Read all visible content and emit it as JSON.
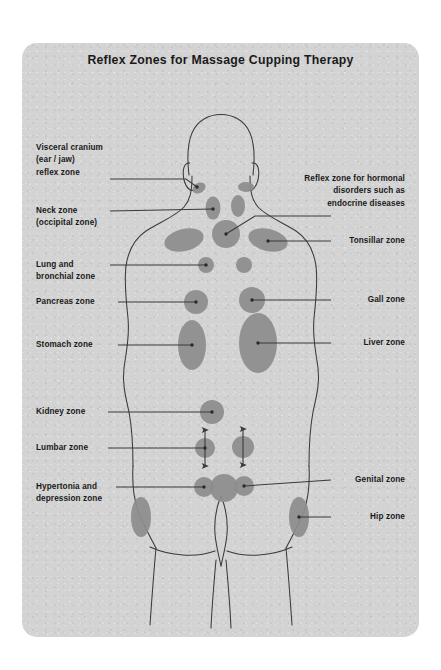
{
  "card": {
    "background_color": "#d3d3d3",
    "zone_color": "#8d8d8d",
    "outline_color": "#3a3a3a",
    "text_color": "#1a1a1a"
  },
  "title": "Reflex Zones for Massage Cupping Therapy",
  "labels_left": [
    {
      "id": "visceral-cranium",
      "text": "Visceral cranium\n(ear / jaw)\nreflex zone"
    },
    {
      "id": "neck-zone",
      "text": "Neck zone\n(occipital zone)"
    },
    {
      "id": "lung-bronchial-zone",
      "text": "Lung and\nbronchial zone"
    },
    {
      "id": "pancreas-zone",
      "text": "Pancreas zone"
    },
    {
      "id": "stomach-zone",
      "text": "Stomach zone"
    },
    {
      "id": "kidney-zone",
      "text": "Kidney zone"
    },
    {
      "id": "lumbar-zone",
      "text": "Lumbar zone"
    },
    {
      "id": "hypertonia-depression-zone",
      "text": "Hypertonia and\ndepression zone"
    }
  ],
  "labels_right": [
    {
      "id": "hormonal-zone",
      "text": "Reflex zone for hormonal\ndisorders such as\nendocrine diseases"
    },
    {
      "id": "tonsillar-zone",
      "text": "Tonsillar zone"
    },
    {
      "id": "gall-zone",
      "text": "Gall zone"
    },
    {
      "id": "liver-zone",
      "text": "Liver zone"
    },
    {
      "id": "genital-zone",
      "text": "Genital zone"
    },
    {
      "id": "hip-zone",
      "text": "Hip zone"
    }
  ],
  "figure": {
    "view": "human back silhouette",
    "zone_markers": 23,
    "arrow_markers": 2
  }
}
